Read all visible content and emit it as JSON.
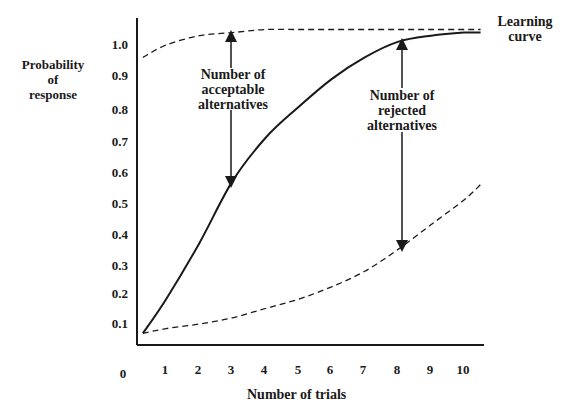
{
  "chart_data": {
    "type": "line",
    "title": "",
    "xlabel": "Number of trials",
    "ylabel": "Probability of response",
    "ylabel_lines": [
      "Probability",
      "of",
      "response"
    ],
    "x_ticks": [
      "0",
      "1",
      "2",
      "3",
      "4",
      "5",
      "6",
      "7",
      "8",
      "9",
      "10"
    ],
    "y_ticks": [
      "0.1",
      "0.2",
      "0.3",
      "0.4",
      "0.5",
      "0.6",
      "0.7",
      "0.8",
      "0.9",
      "1.0"
    ],
    "xlim": [
      0,
      10.5
    ],
    "ylim": [
      0,
      1.1
    ],
    "grid": false,
    "series": [
      {
        "name": "Learning curve",
        "style": "solid",
        "x": [
          0.3,
          1,
          2,
          3,
          4,
          5,
          6,
          7,
          8,
          9,
          10,
          10.5
        ],
        "y": [
          0.07,
          0.18,
          0.36,
          0.56,
          0.7,
          0.8,
          0.89,
          0.96,
          1.01,
          1.03,
          1.04,
          1.04
        ]
      },
      {
        "name": "Upper boundary (acceptable alternatives)",
        "style": "dashed",
        "x": [
          0.3,
          1,
          2,
          3,
          4,
          5,
          6,
          7,
          8,
          9,
          10,
          10.5
        ],
        "y": [
          0.96,
          1.0,
          1.03,
          1.04,
          1.05,
          1.05,
          1.05,
          1.05,
          1.05,
          1.05,
          1.05,
          1.05
        ]
      },
      {
        "name": "Lower boundary (rejected alternatives)",
        "style": "dashed",
        "x": [
          0.3,
          1,
          2,
          3,
          4,
          5,
          6,
          7,
          8,
          9,
          10,
          10.5
        ],
        "y": [
          0.07,
          0.085,
          0.1,
          0.12,
          0.15,
          0.18,
          0.22,
          0.27,
          0.34,
          0.42,
          0.5,
          0.55
        ]
      }
    ],
    "annotations": [
      {
        "text_lines": [
          "Learning",
          "curve"
        ],
        "position": "right end of curves"
      },
      {
        "text_lines": [
          "Number of",
          "acceptable",
          "alternatives"
        ],
        "arrow": "double-headed, x≈3, between learning curve and upper dashed line"
      },
      {
        "text_lines": [
          "Number of",
          "rejected",
          "alternatives"
        ],
        "arrow": "double-headed, x≈8.2, between learning curve and lower dashed line"
      }
    ]
  }
}
